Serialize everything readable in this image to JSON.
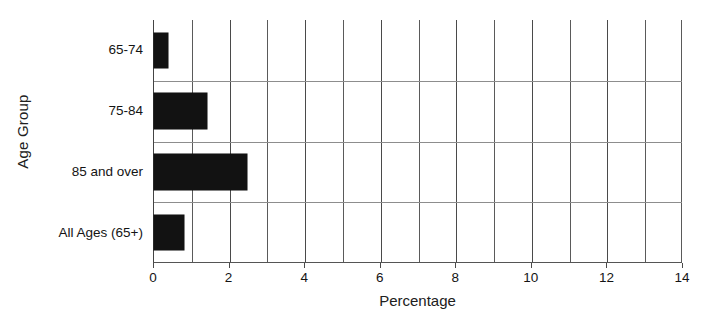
{
  "chart_data": {
    "type": "bar",
    "orientation": "horizontal",
    "title": "",
    "xlabel": "Percentage",
    "ylabel": "Age Group",
    "categories": [
      "65-74",
      "75-84",
      "85 and over",
      "All Ages (65+)"
    ],
    "values": [
      0.37,
      1.4,
      2.45,
      0.8
    ],
    "series": [
      {
        "name": "Percentage",
        "values": [
          0.37,
          1.4,
          2.45,
          0.8
        ]
      }
    ],
    "xlim": [
      0,
      14
    ],
    "xticks": [
      0,
      2,
      4,
      6,
      8,
      10,
      12,
      14
    ],
    "xtick_labels": [
      "0",
      "2",
      "4",
      "6",
      "8",
      "10",
      "12",
      "14"
    ],
    "gridlines": {
      "vertical_step": 1,
      "horizontal": true,
      "grid_on": true
    },
    "bar_color": "#121212",
    "grid_color": "#5a5a5a",
    "legend": null,
    "legend_position": "none"
  }
}
